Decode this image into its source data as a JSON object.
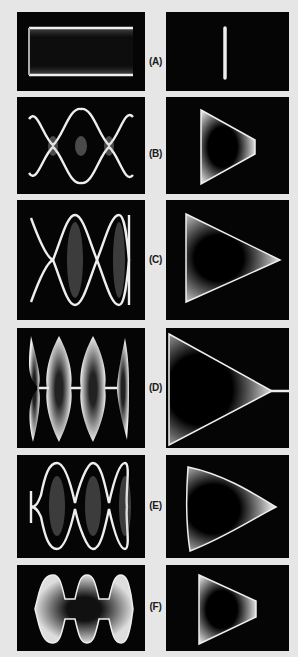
{
  "figure": {
    "background_color": "#e6e6e6",
    "panel_color": "#050505",
    "trace_color": "#f2f2f2",
    "rows": [
      {
        "label": "(A)",
        "left_pattern": "rectangular-envelope",
        "right_pattern": "vertical-line"
      },
      {
        "label": "(B)",
        "left_pattern": "modulated-wave-low-depth",
        "right_pattern": "trapezoid"
      },
      {
        "label": "(C)",
        "left_pattern": "modulated-wave-100-percent",
        "right_pattern": "triangle"
      },
      {
        "label": "(D)",
        "left_pattern": "overmodulated-wave",
        "right_pattern": "triangle-with-tail"
      },
      {
        "label": "(E)",
        "left_pattern": "distorted-modulated-wave",
        "right_pattern": "curved-triangle"
      },
      {
        "label": "(F)",
        "left_pattern": "clipped-modulated-wave",
        "right_pattern": "clipped-trapezoid"
      }
    ]
  }
}
